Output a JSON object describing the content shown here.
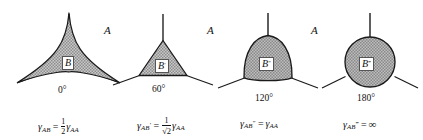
{
  "figure": {
    "matrix_phase_label": "A",
    "background_color": "#ffffff",
    "line_color": "#1a1a1a",
    "fill_color": "#a9a9a9",
    "panels": [
      {
        "id": "panel-0deg",
        "shape": "three-cusped-concave-star",
        "inclusion_label": "B",
        "dihedral_angle": "0°",
        "formula_parts": {
          "lhs_symbol": "γ",
          "lhs_sub": "AB",
          "equals": "=",
          "coefficient_numerator": "1",
          "coefficient_denominator": "2",
          "rhs_symbol": "γ",
          "rhs_sub": "AA"
        },
        "formula_plain": "γAB = 1/2 γAA"
      },
      {
        "id": "panel-60deg",
        "shape": "equilateral-triangle",
        "inclusion_label": "B",
        "inclusion_primes": "′",
        "dihedral_angle": "60°",
        "formula_parts": {
          "lhs_symbol": "γ",
          "lhs_sub": "AB",
          "lhs_prime": "′",
          "equals": "=",
          "coefficient_numerator": "1",
          "coefficient_denominator": "√2",
          "rhs_symbol": "γ",
          "rhs_sub": "AA"
        },
        "formula_plain": "γAB′ = 1/√2 γAA"
      },
      {
        "id": "panel-120deg",
        "shape": "reuleaux-curved-triangle",
        "inclusion_label": "B",
        "inclusion_primes": "″",
        "dihedral_angle": "120°",
        "formula_parts": {
          "lhs_symbol": "γ",
          "lhs_sub": "AB",
          "lhs_prime": "″",
          "equals": "=",
          "rhs_symbol": "γ",
          "rhs_sub": "AA"
        },
        "formula_plain": "γAB″ = γAA"
      },
      {
        "id": "panel-180deg",
        "shape": "circle",
        "inclusion_label": "B",
        "inclusion_primes": "‴",
        "dihedral_angle": "180°",
        "formula_parts": {
          "lhs_symbol": "γ",
          "lhs_sub": "AB",
          "lhs_prime": "‴",
          "equals": "=",
          "rhs_value": "∞"
        },
        "formula_plain": "γAB‴ = ∞"
      }
    ]
  }
}
